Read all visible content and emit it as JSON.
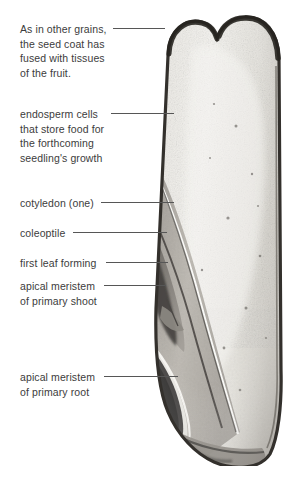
{
  "figure": {
    "background_color": "#ffffff",
    "text_color": "#3c3c3c",
    "leader_color": "#565656"
  },
  "labels": [
    {
      "id": "seed-coat",
      "text": "As in other grains,\nthe seed coat has\nfused with tissues\nof the fruit.",
      "x": 20,
      "y": 22,
      "leader": {
        "x": 113,
        "y": 28,
        "width": 52
      }
    },
    {
      "id": "endosperm",
      "text": "endosperm cells\nthat store food for\nthe forthcoming\nseedling's growth",
      "x": 20,
      "y": 107,
      "leader": {
        "x": 111,
        "y": 113,
        "width": 63
      }
    },
    {
      "id": "cotyledon",
      "text": "cotyledon (one)",
      "x": 20,
      "y": 196,
      "leader": {
        "x": 101,
        "y": 202,
        "width": 73
      }
    },
    {
      "id": "coleoptile",
      "text": "coleoptile",
      "x": 20,
      "y": 226,
      "leader": {
        "x": 73,
        "y": 232,
        "width": 94
      }
    },
    {
      "id": "first-leaf",
      "text": "first leaf forming",
      "x": 20,
      "y": 256,
      "leader": {
        "x": 106,
        "y": 262,
        "width": 62
      }
    },
    {
      "id": "apical-meristem-shoot",
      "text": "apical meristem\nof primary shoot",
      "x": 20,
      "y": 279,
      "leader": {
        "x": 104,
        "y": 285,
        "width": 62
      }
    },
    {
      "id": "apical-meristem-root",
      "text": "apical meristem\nof primary root",
      "x": 20,
      "y": 370,
      "leader": {
        "x": 104,
        "y": 376,
        "width": 74
      }
    }
  ],
  "specimen": {
    "name": "grain-longitudinal-section-photograph",
    "description": "Bilobed heart-shaped top, pale speckled endosperm body, dark embryo with cotyledon, coleoptile, first leaf, and root apex at the base.",
    "colors": {
      "seed_coat": "#3a3631",
      "endosperm_light": "#efeeea",
      "endosperm_mid": "#d9d7d1",
      "embryo_mid": "#a19d97",
      "embryo_dark": "#585551",
      "embryo_darkest": "#3b3936",
      "scutellum": "#b9b5ae",
      "highlight": "#fbfaf7"
    }
  }
}
